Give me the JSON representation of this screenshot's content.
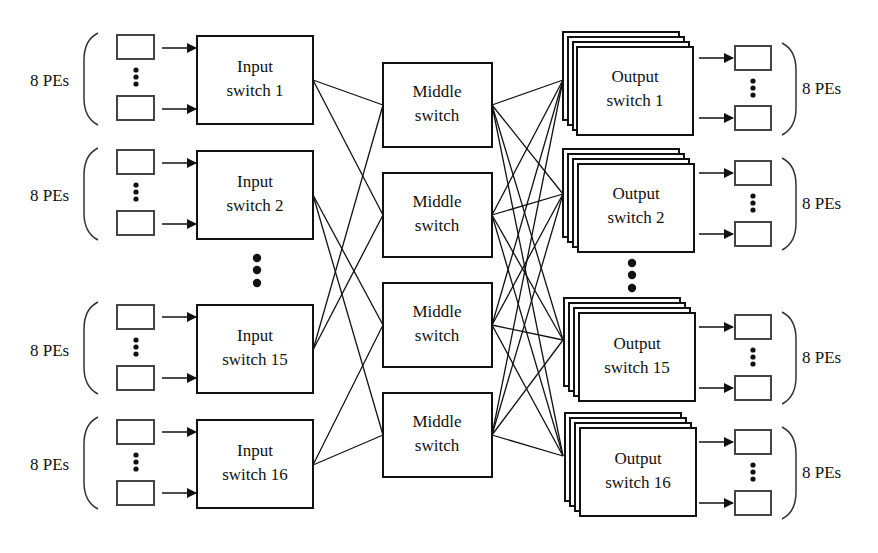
{
  "diagram": {
    "pe_group_label": "8 PEs",
    "input_switches": [
      {
        "line1": "Input",
        "line2": "switch 1",
        "y": 36
      },
      {
        "line1": "Input",
        "line2": "switch 2",
        "y": 151
      },
      {
        "line1": "Input",
        "line2": "switch 15",
        "y": 305
      },
      {
        "line1": "Input",
        "line2": "switch 16",
        "y": 420
      }
    ],
    "middle_switches": [
      {
        "line1": "Middle",
        "line2": "switch",
        "y": 63
      },
      {
        "line1": "Middle",
        "line2": "switch",
        "y": 173
      },
      {
        "line1": "Middle",
        "line2": "switch",
        "y": 283
      },
      {
        "line1": "Middle",
        "line2": "switch",
        "y": 393
      }
    ],
    "output_switches": [
      {
        "line1": "Output",
        "line2": "switch 1",
        "y": 47
      },
      {
        "line1": "Output",
        "line2": "switch 2",
        "y": 164
      },
      {
        "line1": "Output",
        "line2": "switch 15",
        "y": 313
      },
      {
        "line1": "Output",
        "line2": "switch 16",
        "y": 428
      }
    ],
    "ellipsis": "⋮",
    "colors": {
      "stroke": "#111111",
      "pe_stroke": "#444444",
      "background": "#ffffff"
    }
  }
}
